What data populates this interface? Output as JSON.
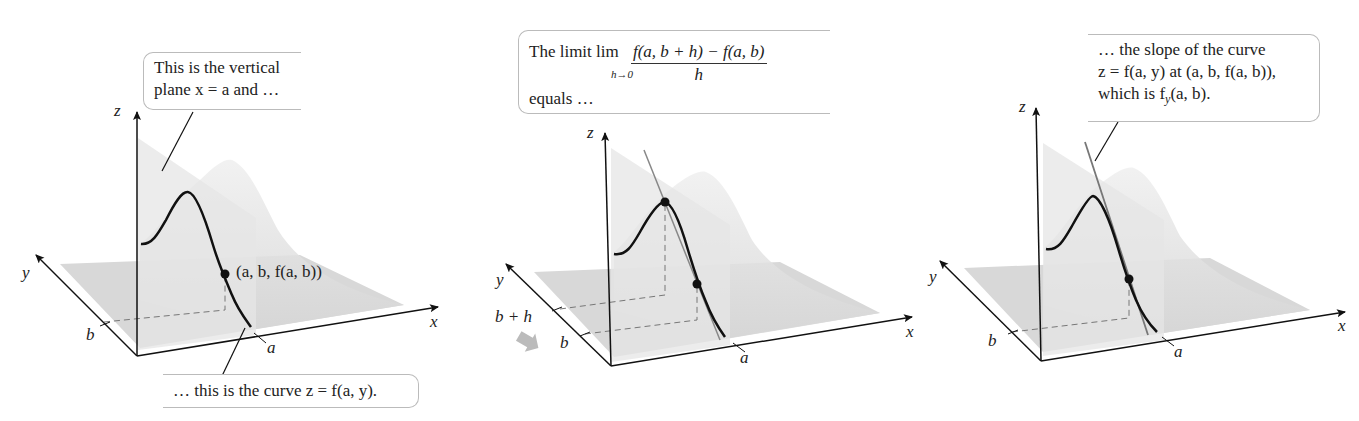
{
  "figure": {
    "panels": [
      {
        "id": "panel-1",
        "callout_top": {
          "line1": "This is the vertical",
          "line2": "plane x = a and …"
        },
        "callout_bottom": "… this is the curve z = f(a, y).",
        "point_label": "(a, b, f(a, b))",
        "axes": {
          "x": "x",
          "y": "y",
          "z": "z"
        },
        "ticks": {
          "a": "a",
          "b": "b"
        }
      },
      {
        "id": "panel-2",
        "callout_top": {
          "prefix": "The limit lim",
          "lim_sub": "h→0",
          "numerator": "f(a, b + h) − f(a, b)",
          "denominator": "h",
          "line2": "equals …"
        },
        "axes": {
          "x": "x",
          "y": "y",
          "z": "z"
        },
        "ticks": {
          "a": "a",
          "b": "b",
          "b_plus_h": "b + h"
        }
      },
      {
        "id": "panel-3",
        "callout_top": {
          "line1": "… the slope of the curve",
          "line2": "z = f(a, y) at (a, b, f(a, b)),",
          "line3_prefix": "which is f",
          "line3_sub": "y",
          "line3_suffix": "(a, b)."
        },
        "axes": {
          "x": "x",
          "y": "y",
          "z": "z"
        },
        "ticks": {
          "a": "a",
          "b": "b"
        }
      }
    ],
    "colors": {
      "curve": "#111111",
      "surface": "#d9d9d9",
      "plane": "#e4e4e4",
      "tangent": "#777777",
      "callout_border": "#bbbbbb"
    }
  }
}
